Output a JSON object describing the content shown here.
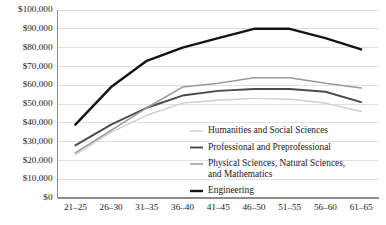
{
  "chart_data": {
    "type": "line",
    "title": "",
    "subtitle": "",
    "xlabel": "",
    "ylabel": "",
    "categories": [
      "21–25",
      "26–30",
      "31–35",
      "36–40",
      "41–45",
      "46–50",
      "51–55",
      "56–60",
      "61–65"
    ],
    "ylim": [
      0,
      100000
    ],
    "ytick_values": [
      0,
      10000,
      20000,
      30000,
      40000,
      50000,
      60000,
      70000,
      80000,
      90000,
      100000
    ],
    "ytick_labels": [
      "$0",
      "$10,000",
      "$20,000",
      "$30,000",
      "$40,000",
      "$50,000",
      "$60,000",
      "$70,000",
      "$80,000",
      "$90,000",
      "$100,000"
    ],
    "grid": true,
    "legend_position": "inside-lower-right",
    "series": [
      {
        "name": "Humanities and Social Sciences",
        "color": "#cfcfcf",
        "width": 1.4,
        "values": [
          23000,
          35000,
          44000,
          50500,
          52000,
          53000,
          52500,
          50500,
          46000
        ]
      },
      {
        "name": "Professional and Preprofessional",
        "color": "#4a4a4a",
        "width": 1.9,
        "values": [
          28000,
          39000,
          48000,
          54500,
          57000,
          58000,
          58000,
          56500,
          51000
        ]
      },
      {
        "name": "Physical Sciences, Natural Sciences, and Mathematics",
        "color": "#9a9a9a",
        "width": 1.5,
        "values": [
          24000,
          36000,
          48000,
          59000,
          61000,
          64000,
          64000,
          61000,
          58500
        ]
      },
      {
        "name": "Engineering",
        "color": "#141414",
        "width": 2.4,
        "values": [
          39000,
          59000,
          73000,
          80000,
          85000,
          90000,
          90000,
          85000,
          79000
        ]
      }
    ]
  },
  "legend": {
    "entries": [
      {
        "label": "Humanities and Social Sciences",
        "label2": ""
      },
      {
        "label": "Professional and Preprofessional",
        "label2": ""
      },
      {
        "label": "Physical Sciences, Natural Sciences,",
        "label2": "and Mathematics"
      },
      {
        "label": "Engineering",
        "label2": ""
      }
    ]
  },
  "axes": {
    "y_labels": [
      "$100,000",
      "$90,000",
      "$80,000",
      "$70,000",
      "$60,000",
      "$50,000",
      "$40,000",
      "$30,000",
      "$20,000",
      "$10,000",
      "$0"
    ],
    "x_labels": [
      "21–25",
      "26–30",
      "31–35",
      "36–40",
      "41–45",
      "46–50",
      "51–55",
      "56–60",
      "61–65"
    ]
  },
  "colors": {
    "grid": "#d8d8d8",
    "axis": "#8c8c8c",
    "text": "#1a1a1a",
    "background": "#ffffff"
  }
}
